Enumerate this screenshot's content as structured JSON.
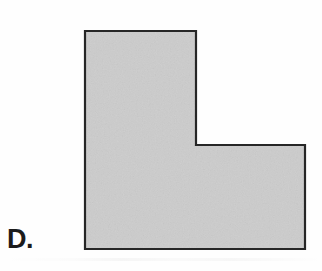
{
  "figure": {
    "label": "D.",
    "caption_text": "D.",
    "shape_name": "L-shaped hexagon",
    "background_color": "#fefefe",
    "fill_color": "#cccccc",
    "stroke_color": "#262626",
    "stroke_width": 2,
    "vertices": [
      {
        "x": 85,
        "y": 31
      },
      {
        "x": 196,
        "y": 31
      },
      {
        "x": 196,
        "y": 145
      },
      {
        "x": 305,
        "y": 145
      },
      {
        "x": 305,
        "y": 249
      },
      {
        "x": 85,
        "y": 249
      }
    ],
    "points_attr": "85,31 196,31 196,145 305,145 305,249 85,249",
    "bounding_box": {
      "left": 85,
      "top": 31,
      "right": 305,
      "bottom": 249,
      "width": 220,
      "height": 218
    },
    "segments": [
      {
        "name": "top-edge",
        "from": "85,31",
        "to": "196,31",
        "length_px": 111
      },
      {
        "name": "upper-right-edge",
        "from": "196,31",
        "to": "196,145",
        "length_px": 114
      },
      {
        "name": "notch-edge",
        "from": "196,145",
        "to": "305,145",
        "length_px": 109
      },
      {
        "name": "right-edge",
        "from": "305,145",
        "to": "305,249",
        "length_px": 104
      },
      {
        "name": "bottom-edge",
        "from": "305,249",
        "to": "85,249",
        "length_px": 220
      },
      {
        "name": "left-edge",
        "from": "85,249",
        "to": "85,31",
        "length_px": 218
      }
    ]
  }
}
